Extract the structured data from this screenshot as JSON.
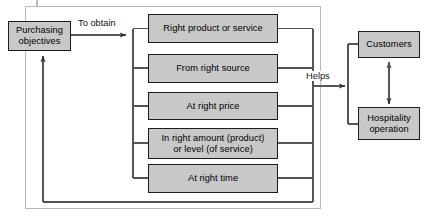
{
  "diagram": {
    "title_text": "",
    "nodes": {
      "purchasing_objectives": "Purchasing\nobjectives",
      "right_product": "Right product or service",
      "right_source": "From right source",
      "right_price": "At right price",
      "right_amount": "In right amount (product)\nor level (of service)",
      "right_time": "At right time",
      "customers": "Customers",
      "hospitality_operation": "Hospitality\noperation"
    },
    "edge_labels": {
      "to_obtain": "To obtain",
      "helps": "Helps"
    },
    "colors": {
      "node_fill": "#c8c8c8",
      "node_stroke": "#1c1c1c",
      "line": "#555555",
      "frame": "#b9b9b9",
      "text": "#000000",
      "background": "#ffffff"
    }
  }
}
